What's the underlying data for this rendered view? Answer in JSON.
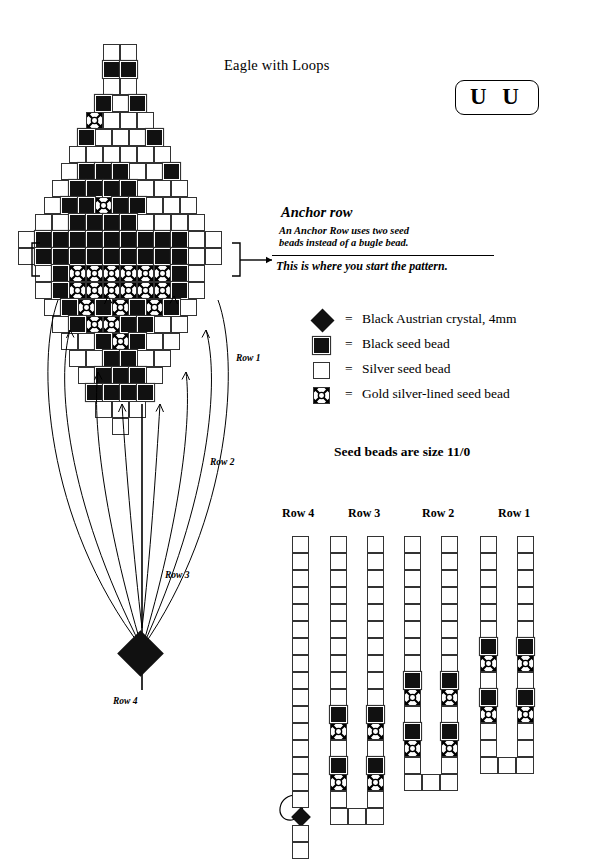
{
  "header": {
    "title": "Eagle with Loops",
    "badge": "U U"
  },
  "anchor": {
    "heading": "Anchor row",
    "line1": "An Anchor Row uses two seed",
    "line2": "beads instead of a bugle bead.",
    "line3": "This is where you start the pattern."
  },
  "legend": {
    "equals": "=",
    "items": [
      {
        "swatch": "crystal-diamond",
        "label": "Black Austrian crystal, 4mm",
        "color": "#111111"
      },
      {
        "swatch": "black-square",
        "label": "Black seed bead",
        "color": "#111111"
      },
      {
        "swatch": "white-square",
        "label": "Silver seed bead",
        "color": "#ffffff"
      },
      {
        "swatch": "gold-square",
        "label": "Gold silver-lined seed bead",
        "color": "#ffffff"
      }
    ],
    "note": "Seed beads are size 11/0"
  },
  "loop_labels": {
    "row1": "Row 1",
    "row2": "Row 2",
    "row3": "Row 3",
    "row4": "Row 4"
  },
  "strips": {
    "headers": [
      "Row 4",
      "Row 3",
      "Row 2",
      "Row 1"
    ],
    "row4": {
      "label": "Row 4",
      "columns": 1,
      "cells": [
        "W",
        "W",
        "W",
        "W",
        "W",
        "W",
        "W",
        "W",
        "W",
        "W",
        "W",
        "W",
        "W",
        "W",
        "W",
        "W",
        "D",
        "W",
        "W"
      ],
      "has_loop_arrow": true
    },
    "row3": {
      "label": "Row 3",
      "columns": 2,
      "cells": [
        "W",
        "W",
        "W",
        "W",
        "W",
        "W",
        "W",
        "W",
        "W",
        "W",
        "K",
        "G",
        "W",
        "K",
        "G",
        "W"
      ],
      "base_cells": 3
    },
    "row2": {
      "label": "Row 2",
      "columns": 2,
      "cells": [
        "W",
        "W",
        "W",
        "W",
        "W",
        "W",
        "W",
        "W",
        "K",
        "G",
        "W",
        "K",
        "G",
        "W"
      ],
      "base_cells": 3
    },
    "row1": {
      "label": "Row 1",
      "columns": 2,
      "cells": [
        "W",
        "W",
        "W",
        "W",
        "W",
        "W",
        "K",
        "G",
        "W",
        "K",
        "G",
        "W",
        "W"
      ],
      "base_cells": 3
    }
  },
  "eagle": {
    "cell": 17,
    "legend_keys": {
      "W": "silver",
      "K": "black",
      "G": "gold",
      "D": "crystal"
    },
    "rows": [
      {
        "y": 0,
        "cells": [
          "W",
          "W"
        ]
      },
      {
        "y": 1,
        "cells": [
          "K",
          "K"
        ]
      },
      {
        "y": 2,
        "cells": [
          "W",
          "W"
        ]
      },
      {
        "y": 3,
        "cells": [
          "K",
          "W",
          "K"
        ]
      },
      {
        "y": 4,
        "cells": [
          "G",
          "W",
          "W",
          "W"
        ]
      },
      {
        "y": 5,
        "cells": [
          "K",
          "W",
          "W",
          "W",
          "K"
        ]
      },
      {
        "y": 6,
        "cells": [
          "W",
          "W",
          "W",
          "W",
          "W",
          "W"
        ]
      },
      {
        "y": 7,
        "cells": [
          "W",
          "K",
          "K",
          "K",
          "W",
          "W",
          "K"
        ]
      },
      {
        "y": 8,
        "cells": [
          "W",
          "K",
          "K",
          "K",
          "K",
          "W",
          "W",
          "W"
        ]
      },
      {
        "y": 9,
        "cells": [
          "W",
          "K",
          "K",
          "G",
          "K",
          "K",
          "W",
          "W",
          "W"
        ]
      },
      {
        "y": 10,
        "cells": [
          "W",
          "W",
          "K",
          "K",
          "K",
          "K",
          "W",
          "W",
          "W",
          "W"
        ]
      },
      {
        "y": 11,
        "cells": [
          "W",
          "K",
          "K",
          "K",
          "K",
          "K",
          "K",
          "K",
          "K",
          "K",
          "W",
          "W"
        ]
      },
      {
        "y": 12,
        "cells": [
          "W",
          "K",
          "K",
          "K",
          "K",
          "K",
          "K",
          "K",
          "K",
          "K",
          "W",
          "W"
        ]
      },
      {
        "y": 13,
        "cells": [
          "W",
          "K",
          "G",
          "G",
          "G",
          "G",
          "G",
          "G",
          "K",
          "W"
        ]
      },
      {
        "y": 14,
        "cells": [
          "W",
          "K",
          "G",
          "G",
          "G",
          "G",
          "G",
          "G",
          "K",
          "W"
        ]
      },
      {
        "y": 15,
        "cells": [
          "W",
          "K",
          "G",
          "K",
          "G",
          "K",
          "G",
          "K",
          "W"
        ]
      },
      {
        "y": 16,
        "cells": [
          "W",
          "K",
          "G",
          "G",
          "K",
          "K",
          "W",
          "W"
        ]
      },
      {
        "y": 17,
        "cells": [
          "W",
          "W",
          "K",
          "G",
          "K",
          "W",
          "W"
        ]
      },
      {
        "y": 18,
        "cells": [
          "W",
          "W",
          "K",
          "K",
          "W",
          "W"
        ]
      },
      {
        "y": 19,
        "cells": [
          "W",
          "K",
          "K",
          "K",
          "W"
        ]
      },
      {
        "y": 20,
        "cells": [
          "K",
          "K",
          "K",
          "K"
        ]
      },
      {
        "y": 21,
        "cells": [
          "W",
          "W",
          "W"
        ]
      },
      {
        "y": 22,
        "cells": [
          "W"
        ]
      }
    ]
  }
}
